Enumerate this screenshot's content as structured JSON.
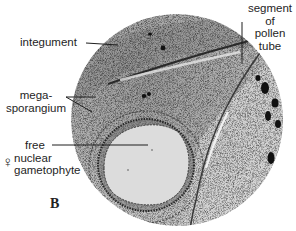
{
  "figure": {
    "panel_letter": "B",
    "labels": {
      "integument": "integument",
      "pollen_tube": [
        "segment",
        "of",
        "pollen",
        "tube"
      ],
      "megasporangium": [
        "mega-",
        "sporangium"
      ],
      "gametophyte": [
        "free",
        "nuclear",
        "gametophyte"
      ],
      "female_symbol": "♀"
    },
    "colors": {
      "background": "#ffffff",
      "tissue": "#a9a9a9",
      "ink": "#1e1e1e"
    }
  }
}
